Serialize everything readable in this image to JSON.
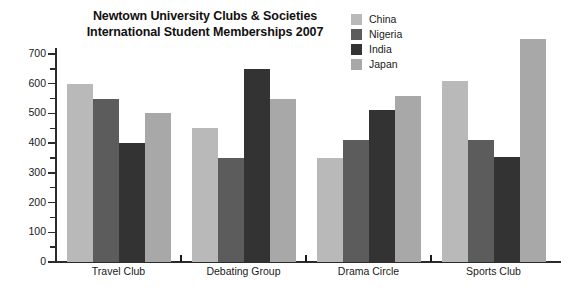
{
  "chart_data": {
    "type": "bar",
    "title": "Newtown University Clubs & Societies International Student Memberships 2007",
    "title_lines": [
      "Newtown University Clubs & Societies",
      "International Student Memberships 2007"
    ],
    "xlabel": "",
    "ylabel": "",
    "ylim": [
      0,
      750
    ],
    "ytick_step": 100,
    "yminor_step": 50,
    "grid": false,
    "legend_position": "top-right",
    "categories": [
      "Travel Club",
      "Debating Group",
      "Drama Circle",
      "Sports Club"
    ],
    "ytick_labels": [
      "0",
      "100",
      "200",
      "300",
      "400",
      "500",
      "600",
      "700"
    ],
    "ytick_values": [
      0,
      100,
      200,
      300,
      400,
      500,
      600,
      700
    ],
    "series": [
      {
        "name": "China",
        "color": "#b9b9b9",
        "values": [
          600,
          450,
          350,
          610
        ]
      },
      {
        "name": "Nigeria",
        "color": "#5c5c5c",
        "values": [
          550,
          350,
          410,
          410
        ]
      },
      {
        "name": "India",
        "color": "#333333",
        "values": [
          400,
          650,
          510,
          355
        ]
      },
      {
        "name": "Japan",
        "color": "#a8a8a8",
        "values": [
          500,
          550,
          560,
          750
        ]
      }
    ]
  },
  "legend": {
    "entries": [
      {
        "label": "China",
        "color": "#b9b9b9"
      },
      {
        "label": "Nigeria",
        "color": "#5c5c5c"
      },
      {
        "label": "India",
        "color": "#333333"
      },
      {
        "label": "Japan",
        "color": "#a8a8a8"
      }
    ]
  },
  "axis": {
    "line_color": "#2b2b2b",
    "text_color": "#1a1a1a"
  }
}
